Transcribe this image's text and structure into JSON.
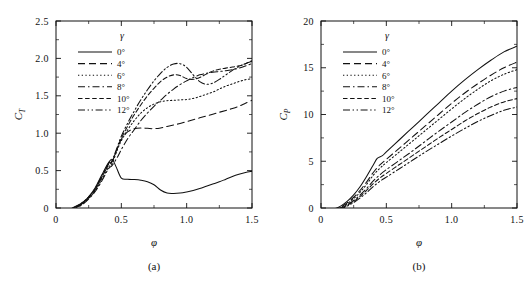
{
  "figure": {
    "panels": [
      "a",
      "b"
    ]
  },
  "chart_data": [
    {
      "type": "line",
      "panel_label": "(a)",
      "title": "",
      "xlabel": "φ",
      "ylabel": "C_T",
      "ylabel_base": "C",
      "ylabel_sub": "T",
      "xlim": [
        0,
        1.5
      ],
      "ylim": [
        0,
        2.5
      ],
      "xticks": [
        0,
        0.5,
        1.0,
        1.5
      ],
      "xticklabels": [
        "0",
        "0.5",
        "1.0",
        "1.5"
      ],
      "yticks": [
        0,
        0.5,
        1.0,
        1.5,
        2.0,
        2.5
      ],
      "yticklabels": [
        "0",
        "0.5",
        "1.0",
        "1.5",
        "2.0",
        "2.5"
      ],
      "grid": false,
      "legend_position": "upper-left",
      "legend_title": "γ",
      "series": [
        {
          "name": "0°",
          "style": "solid",
          "x": [
            0.0,
            0.05,
            0.1,
            0.15,
            0.2,
            0.25,
            0.3,
            0.35,
            0.4,
            0.43,
            0.46,
            0.5,
            0.55,
            0.6,
            0.65,
            0.7,
            0.75,
            0.8,
            0.85,
            0.9,
            0.95,
            1.0,
            1.05,
            1.1,
            1.15,
            1.2,
            1.25,
            1.3,
            1.35,
            1.4,
            1.45,
            1.5
          ],
          "y": [
            -0.04,
            -0.04,
            -0.02,
            0.02,
            0.07,
            0.15,
            0.27,
            0.44,
            0.6,
            0.65,
            0.55,
            0.4,
            0.385,
            0.38,
            0.37,
            0.35,
            0.31,
            0.24,
            0.2,
            0.195,
            0.2,
            0.215,
            0.235,
            0.26,
            0.29,
            0.32,
            0.35,
            0.385,
            0.42,
            0.45,
            0.475,
            0.49
          ]
        },
        {
          "name": "4°",
          "style": "dashed",
          "x": [
            0.0,
            0.05,
            0.1,
            0.15,
            0.2,
            0.25,
            0.3,
            0.35,
            0.4,
            0.43,
            0.47,
            0.5,
            0.55,
            0.6,
            0.65,
            0.7,
            0.75,
            0.8,
            0.85,
            0.9,
            0.95,
            1.0,
            1.05,
            1.1,
            1.15,
            1.2,
            1.25,
            1.3,
            1.35,
            1.4,
            1.45,
            1.5
          ],
          "y": [
            -0.045,
            -0.045,
            -0.025,
            0.01,
            0.06,
            0.14,
            0.25,
            0.41,
            0.57,
            0.62,
            0.8,
            0.92,
            1.02,
            1.06,
            1.07,
            1.065,
            1.06,
            1.07,
            1.09,
            1.11,
            1.13,
            1.155,
            1.18,
            1.205,
            1.23,
            1.255,
            1.28,
            1.305,
            1.33,
            1.36,
            1.4,
            1.44
          ]
        },
        {
          "name": "6°",
          "style": "dotted",
          "x": [
            0.0,
            0.05,
            0.1,
            0.15,
            0.2,
            0.25,
            0.3,
            0.35,
            0.4,
            0.43,
            0.47,
            0.5,
            0.55,
            0.6,
            0.65,
            0.7,
            0.75,
            0.8,
            0.85,
            0.9,
            0.95,
            1.0,
            1.05,
            1.1,
            1.15,
            1.2,
            1.25,
            1.3,
            1.35,
            1.4,
            1.45,
            1.5
          ],
          "y": [
            -0.05,
            -0.05,
            -0.03,
            0.005,
            0.05,
            0.13,
            0.23,
            0.38,
            0.54,
            0.6,
            0.78,
            0.9,
            1.05,
            1.17,
            1.27,
            1.34,
            1.39,
            1.42,
            1.435,
            1.44,
            1.445,
            1.45,
            1.465,
            1.49,
            1.52,
            1.55,
            1.59,
            1.63,
            1.66,
            1.69,
            1.715,
            1.73
          ]
        },
        {
          "name": "8°",
          "style": "dashdot",
          "x": [
            0.0,
            0.05,
            0.1,
            0.15,
            0.2,
            0.25,
            0.3,
            0.35,
            0.4,
            0.43,
            0.47,
            0.5,
            0.55,
            0.6,
            0.65,
            0.7,
            0.75,
            0.8,
            0.85,
            0.9,
            0.95,
            1.0,
            1.05,
            1.1,
            1.15,
            1.2,
            1.25,
            1.3,
            1.35,
            1.4,
            1.45,
            1.5
          ],
          "y": [
            -0.05,
            -0.05,
            -0.03,
            0.0,
            0.045,
            0.12,
            0.22,
            0.36,
            0.52,
            0.57,
            0.68,
            0.78,
            0.93,
            1.05,
            1.17,
            1.27,
            1.36,
            1.44,
            1.52,
            1.59,
            1.65,
            1.7,
            1.745,
            1.78,
            1.8,
            1.815,
            1.825,
            1.835,
            1.85,
            1.87,
            1.9,
            1.93
          ]
        },
        {
          "name": "10°",
          "style": "densedash",
          "x": [
            0.0,
            0.05,
            0.1,
            0.15,
            0.2,
            0.25,
            0.3,
            0.35,
            0.4,
            0.43,
            0.47,
            0.5,
            0.55,
            0.6,
            0.65,
            0.7,
            0.75,
            0.8,
            0.85,
            0.9,
            0.95,
            1.0,
            1.05,
            1.1,
            1.15,
            1.2,
            1.25,
            1.3,
            1.35,
            1.4,
            1.45,
            1.5
          ],
          "y": [
            -0.045,
            -0.045,
            -0.025,
            0.01,
            0.06,
            0.14,
            0.25,
            0.41,
            0.58,
            0.63,
            0.8,
            0.93,
            1.1,
            1.25,
            1.38,
            1.5,
            1.6,
            1.69,
            1.75,
            1.78,
            1.77,
            1.73,
            1.72,
            1.745,
            1.79,
            1.83,
            1.855,
            1.87,
            1.885,
            1.9,
            1.93,
            1.97
          ]
        },
        {
          "name": "12°",
          "style": "dashdotdot",
          "x": [
            0.0,
            0.05,
            0.1,
            0.15,
            0.2,
            0.25,
            0.3,
            0.35,
            0.4,
            0.43,
            0.47,
            0.5,
            0.55,
            0.6,
            0.65,
            0.7,
            0.75,
            0.8,
            0.85,
            0.9,
            0.95,
            1.0,
            1.05,
            1.1,
            1.15,
            1.2,
            1.25,
            1.3,
            1.35,
            1.4,
            1.45,
            1.5
          ],
          "y": [
            -0.04,
            -0.04,
            -0.02,
            0.02,
            0.07,
            0.15,
            0.26,
            0.43,
            0.59,
            0.64,
            0.82,
            0.96,
            1.14,
            1.3,
            1.45,
            1.58,
            1.7,
            1.8,
            1.88,
            1.925,
            1.93,
            1.88,
            1.78,
            1.69,
            1.655,
            1.67,
            1.72,
            1.78,
            1.84,
            1.89,
            1.93,
            1.96
          ]
        }
      ]
    },
    {
      "type": "line",
      "panel_label": "(b)",
      "title": "",
      "xlabel": "φ",
      "ylabel": "C_P",
      "ylabel_base": "C",
      "ylabel_sub": "P",
      "xlim": [
        0,
        1.5
      ],
      "ylim": [
        0,
        20
      ],
      "xticks": [
        0,
        0.5,
        1.0,
        1.5
      ],
      "xticklabels": [
        "0",
        "0.5",
        "1.0",
        "1.5"
      ],
      "yticks": [
        0,
        5,
        10,
        15,
        20
      ],
      "yticklabels": [
        "0",
        "5",
        "10",
        "15",
        "20"
      ],
      "grid": false,
      "legend_position": "upper-left",
      "legend_title": "γ",
      "series": [
        {
          "name": "0°",
          "style": "solid",
          "x": [
            0.0,
            0.05,
            0.1,
            0.15,
            0.2,
            0.25,
            0.3,
            0.35,
            0.4,
            0.43,
            0.47,
            0.5,
            0.6,
            0.7,
            0.8,
            0.9,
            1.0,
            1.1,
            1.2,
            1.3,
            1.4,
            1.5
          ],
          "y": [
            -0.3,
            -0.25,
            -0.1,
            0.2,
            0.7,
            1.4,
            2.3,
            3.4,
            4.6,
            5.3,
            5.6,
            6.0,
            7.3,
            8.6,
            9.9,
            11.2,
            12.5,
            13.7,
            14.8,
            15.8,
            16.7,
            17.3
          ]
        },
        {
          "name": "4°",
          "style": "dashed",
          "x": [
            0.0,
            0.05,
            0.1,
            0.15,
            0.2,
            0.25,
            0.3,
            0.35,
            0.4,
            0.45,
            0.5,
            0.6,
            0.7,
            0.8,
            0.9,
            1.0,
            1.1,
            1.2,
            1.3,
            1.4,
            1.5
          ],
          "y": [
            -0.35,
            -0.3,
            -0.15,
            0.1,
            0.55,
            1.15,
            1.9,
            2.8,
            3.8,
            4.6,
            5.2,
            6.4,
            7.6,
            8.8,
            10.0,
            11.2,
            12.3,
            13.3,
            14.2,
            15.0,
            15.6
          ]
        },
        {
          "name": "6°",
          "style": "dotted",
          "x": [
            0.0,
            0.05,
            0.1,
            0.15,
            0.2,
            0.25,
            0.3,
            0.35,
            0.4,
            0.45,
            0.5,
            0.6,
            0.7,
            0.8,
            0.9,
            1.0,
            1.1,
            1.2,
            1.3,
            1.4,
            1.5
          ],
          "y": [
            -0.35,
            -0.3,
            -0.18,
            0.05,
            0.45,
            1.0,
            1.7,
            2.55,
            3.5,
            4.25,
            4.85,
            6.0,
            7.15,
            8.3,
            9.45,
            10.6,
            11.7,
            12.7,
            13.6,
            14.3,
            14.8
          ]
        },
        {
          "name": "8°",
          "style": "dashdot",
          "x": [
            0.0,
            0.05,
            0.1,
            0.15,
            0.2,
            0.25,
            0.3,
            0.35,
            0.4,
            0.45,
            0.5,
            0.6,
            0.7,
            0.8,
            0.9,
            1.0,
            1.1,
            1.2,
            1.3,
            1.4,
            1.5
          ],
          "y": [
            -0.4,
            -0.35,
            -0.22,
            0.0,
            0.35,
            0.8,
            1.4,
            2.1,
            2.9,
            3.55,
            4.1,
            5.1,
            6.1,
            7.15,
            8.2,
            9.2,
            10.2,
            11.1,
            11.9,
            12.5,
            12.9
          ]
        },
        {
          "name": "10°",
          "style": "densedash",
          "x": [
            0.0,
            0.05,
            0.1,
            0.15,
            0.2,
            0.25,
            0.3,
            0.35,
            0.4,
            0.45,
            0.5,
            0.6,
            0.7,
            0.8,
            0.9,
            1.0,
            1.1,
            1.2,
            1.3,
            1.4,
            1.5
          ],
          "y": [
            -0.4,
            -0.38,
            -0.25,
            -0.05,
            0.28,
            0.7,
            1.25,
            1.9,
            2.6,
            3.2,
            3.7,
            4.65,
            5.6,
            6.55,
            7.5,
            8.4,
            9.3,
            10.1,
            10.8,
            11.35,
            11.7
          ]
        },
        {
          "name": "12°",
          "style": "dashdotdot",
          "x": [
            0.0,
            0.05,
            0.1,
            0.15,
            0.2,
            0.25,
            0.3,
            0.35,
            0.4,
            0.45,
            0.5,
            0.6,
            0.7,
            0.8,
            0.9,
            1.0,
            1.1,
            1.2,
            1.3,
            1.4,
            1.5
          ],
          "y": [
            -0.45,
            -0.42,
            -0.3,
            -0.1,
            0.2,
            0.58,
            1.08,
            1.65,
            2.3,
            2.85,
            3.3,
            4.2,
            5.1,
            6.0,
            6.85,
            7.7,
            8.5,
            9.25,
            9.9,
            10.45,
            10.8
          ]
        }
      ]
    }
  ]
}
